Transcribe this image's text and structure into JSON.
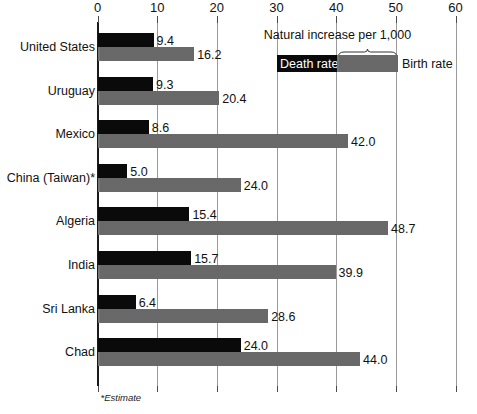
{
  "chart_data": {
    "type": "bar",
    "title": "",
    "orientation": "horizontal",
    "xlabel": "",
    "ylabel": "",
    "xlim": [
      0,
      60
    ],
    "xticks": [
      0,
      10,
      20,
      30,
      40,
      50,
      60
    ],
    "xtick_labels": [
      "0",
      "10",
      "20",
      "30",
      "40",
      "50",
      "60"
    ],
    "grid": true,
    "legend_position": "top-right",
    "categories": [
      "United States",
      "Uruguay",
      "Mexico",
      "China (Taiwan)*",
      "Algeria",
      "India",
      "Sri Lanka",
      "Chad"
    ],
    "series": [
      {
        "name": "Death rate",
        "color": "#0a0a0a",
        "values": [
          9.4,
          9.3,
          8.6,
          5.0,
          15.4,
          15.7,
          6.4,
          24.0
        ],
        "value_labels": [
          "9.4",
          "9.3",
          "8.6",
          "5.0",
          "15.4",
          "15.7",
          "6.4",
          "24.0"
        ]
      },
      {
        "name": "Birth rate",
        "color": "#6e6e6e",
        "values": [
          16.2,
          20.4,
          42.0,
          24.0,
          48.7,
          39.9,
          28.6,
          44.0
        ],
        "value_labels": [
          "16.2",
          "20.4",
          "42.0",
          "24.0",
          "48.7",
          "39.9",
          "28.6",
          "44.0"
        ]
      }
    ],
    "annotations": [
      "Natural increase per 1,000",
      "*Estimate"
    ]
  },
  "legend": {
    "title": "Natural increase per 1,000",
    "death_label": "Death rate",
    "birth_label": "Birth rate"
  },
  "footnote": {
    "text": "*Estimate"
  }
}
